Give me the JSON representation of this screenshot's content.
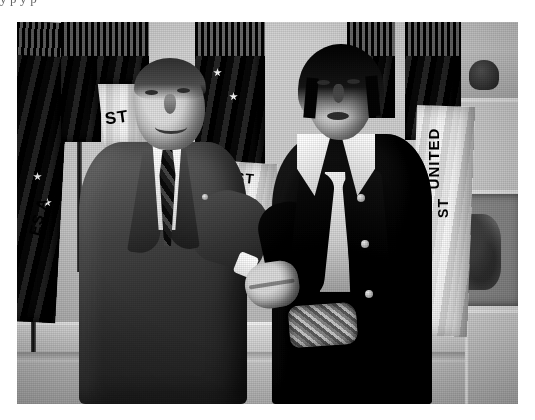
{
  "page": {
    "background_color": "#ffffff",
    "cutoff_text_line": "y  p                                                   y     p"
  },
  "photo": {
    "name": "nixon-elvis-handshake-photograph",
    "description": "Black-and-white halftone photograph of President Richard Nixon shaking hands with Elvis Presley in the Oval Office",
    "rendering": "halftone / dithered grayscale newspaper scan",
    "frame": {
      "x": 17,
      "y": 22,
      "width": 501,
      "height": 382
    },
    "palette": {
      "paper": "#ffffff",
      "photo_light": "#d6d6d2",
      "photo_mid": "#8e8e8a",
      "photo_dark": "#141410",
      "buckle_gold": "#c7bd94"
    },
    "subjects": [
      {
        "name": "richard-nixon",
        "position": "left",
        "attire": "dark business suit with wide lapels, white shirt, striped necktie, lapel pin",
        "pose": "smiling, shaking hands with right hand"
      },
      {
        "name": "elvis-presley",
        "position": "right",
        "attire": "dark velvet overcoat with high white collared shirt, large ornate gold belt buckle",
        "pose": "facing camera, shaking hands with left hand"
      }
    ],
    "background_elements": [
      {
        "name": "oval-office-wall",
        "detail": "pale paneled wall with baseboard trim"
      },
      {
        "name": "flag-cluster-left",
        "detail": "group of dark ceremonial flags with gold fringe"
      },
      {
        "name": "flag-cluster-center",
        "detail": "dark fringed standard behind the two men"
      },
      {
        "name": "flag-cluster-right",
        "detail": "pale fringed flags with vertical lettering"
      },
      {
        "name": "framed-artwork",
        "detail": "framed picture on the right wall"
      },
      {
        "name": "shelf-object",
        "detail": "dark object on upper right shelf"
      }
    ],
    "flag_lettering": [
      {
        "name": "flag-text-left",
        "text": "ES A"
      },
      {
        "name": "flag-text-nixon",
        "text": "ST"
      },
      {
        "name": "flag-text-center",
        "text": "ST"
      },
      {
        "name": "flag-text-united",
        "text": "UNITED"
      },
      {
        "name": "flag-text-right-lower",
        "text": "ST"
      }
    ]
  }
}
